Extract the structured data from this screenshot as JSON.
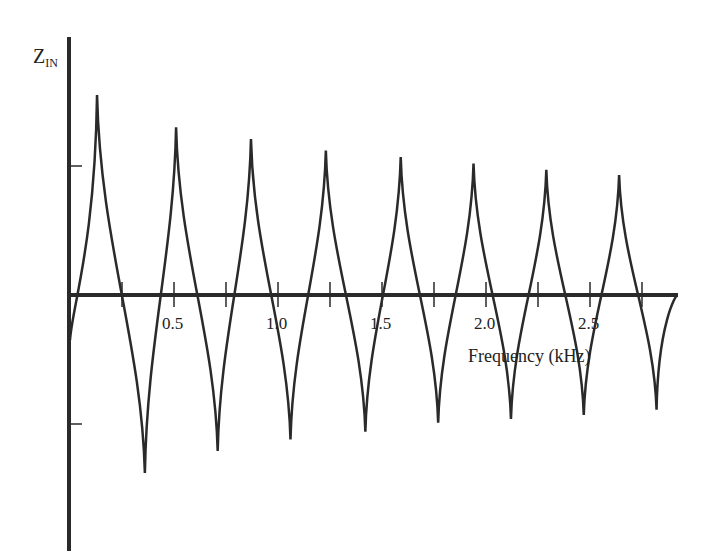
{
  "chart_data": {
    "type": "line",
    "title": "",
    "xlabel": "Frequency (kHz)",
    "ylabel": "Z_IN",
    "ylabel_main": "Z",
    "ylabel_sub": "IN",
    "x_ticks": [
      0.25,
      0.5,
      0.75,
      1.0,
      1.25,
      1.5,
      1.75,
      2.0,
      2.25,
      2.5,
      2.75
    ],
    "x_tick_labels": [
      "0.5",
      "1.0",
      "1.5",
      "2.0",
      "2.5"
    ],
    "xlim": [
      0,
      2.9
    ],
    "grid": false,
    "legend": null,
    "series": [
      {
        "name": "Z_IN",
        "peaks": [
          {
            "x": 0.13,
            "y": 1.55
          },
          {
            "x": 0.51,
            "y": 1.3
          },
          {
            "x": 0.87,
            "y": 1.21
          },
          {
            "x": 1.23,
            "y": 1.12
          },
          {
            "x": 1.59,
            "y": 1.07
          },
          {
            "x": 1.94,
            "y": 1.02
          },
          {
            "x": 2.29,
            "y": 0.97
          },
          {
            "x": 2.64,
            "y": 0.93
          }
        ],
        "troughs": [
          {
            "x": 0.0,
            "y": -0.35
          },
          {
            "x": 0.36,
            "y": -1.38
          },
          {
            "x": 0.71,
            "y": -1.21
          },
          {
            "x": 1.06,
            "y": -1.12
          },
          {
            "x": 1.42,
            "y": -1.06
          },
          {
            "x": 1.77,
            "y": -0.99
          },
          {
            "x": 2.12,
            "y": -0.96
          },
          {
            "x": 2.47,
            "y": -0.93
          },
          {
            "x": 2.82,
            "y": -0.89
          }
        ]
      }
    ]
  },
  "labels": {
    "y_main": "Z",
    "y_sub": "IN",
    "x_axis": "Frequency (kHz)",
    "ticks": [
      "0.5",
      "1.0",
      "1.5",
      "2.0",
      "2.5"
    ]
  },
  "colors": {
    "line": "#2a2a2a",
    "background": "#ffffff"
  }
}
